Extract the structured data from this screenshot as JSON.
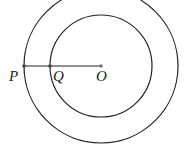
{
  "diagram": {
    "center": {
      "label": "O",
      "x": 101,
      "y": 66
    },
    "circles": [
      {
        "name": "outer",
        "r": 77
      },
      {
        "name": "inner",
        "r": 51
      }
    ],
    "points": [
      {
        "label": "P",
        "x": 24,
        "y": 66
      },
      {
        "label": "Q",
        "x": 50,
        "y": 66
      },
      {
        "label": "O",
        "x": 101,
        "y": 66
      }
    ],
    "segment": {
      "from": "P",
      "to": "O"
    },
    "colors": {
      "stroke": "#222222",
      "background": "#ffffff"
    }
  }
}
